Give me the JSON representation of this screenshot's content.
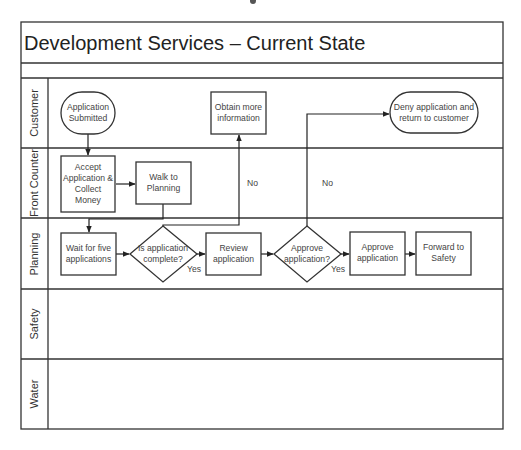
{
  "diagram": {
    "title": "Development Services – Current State",
    "type": "swimlane flowchart",
    "lanes": [
      {
        "id": "customer",
        "label": "Customer"
      },
      {
        "id": "front_counter",
        "label": "Front Counter"
      },
      {
        "id": "planning",
        "label": "Planning"
      },
      {
        "id": "safety",
        "label": "Safety"
      },
      {
        "id": "water",
        "label": "Water"
      }
    ],
    "nodes": {
      "app_submitted": {
        "lane": "customer",
        "shape": "terminator",
        "lines": [
          "Application",
          "Submitted"
        ]
      },
      "obtain_info": {
        "lane": "customer",
        "shape": "process",
        "lines": [
          "Obtain more",
          "information"
        ]
      },
      "deny": {
        "lane": "customer",
        "shape": "terminator",
        "lines": [
          "Deny application and",
          "return to customer"
        ]
      },
      "accept": {
        "lane": "front_counter",
        "shape": "process",
        "lines": [
          "Accept",
          "Application &",
          "Collect",
          "Money"
        ]
      },
      "walk": {
        "lane": "front_counter",
        "shape": "process",
        "lines": [
          "Walk to",
          "Planning"
        ]
      },
      "wait": {
        "lane": "planning",
        "shape": "process",
        "lines": [
          "Wait for five",
          "applications"
        ]
      },
      "is_complete": {
        "lane": "planning",
        "shape": "decision",
        "lines": [
          "Is application",
          "complete?"
        ]
      },
      "review": {
        "lane": "planning",
        "shape": "process",
        "lines": [
          "Review",
          "application"
        ]
      },
      "approve_q": {
        "lane": "planning",
        "shape": "decision",
        "lines": [
          "Approve",
          "application?"
        ]
      },
      "approve": {
        "lane": "planning",
        "shape": "process",
        "lines": [
          "Approve",
          "application"
        ]
      },
      "forward": {
        "lane": "planning",
        "shape": "process",
        "lines": [
          "Forward to",
          "Safety"
        ]
      }
    },
    "edges": [
      {
        "from": "app_submitted",
        "to": "accept",
        "label": ""
      },
      {
        "from": "accept",
        "to": "walk",
        "label": ""
      },
      {
        "from": "walk",
        "to": "wait",
        "label": ""
      },
      {
        "from": "wait",
        "to": "is_complete",
        "label": ""
      },
      {
        "from": "is_complete",
        "to": "review",
        "label": "Yes"
      },
      {
        "from": "is_complete",
        "to": "obtain_info",
        "label": "No"
      },
      {
        "from": "review",
        "to": "approve_q",
        "label": ""
      },
      {
        "from": "approve_q",
        "to": "approve",
        "label": "Yes"
      },
      {
        "from": "approve_q",
        "to": "deny",
        "label": "No"
      },
      {
        "from": "approve",
        "to": "forward",
        "label": ""
      }
    ],
    "edge_labels": {
      "complete_yes": "Yes",
      "complete_no": "No",
      "approve_yes": "Yes",
      "approve_no": "No"
    }
  }
}
